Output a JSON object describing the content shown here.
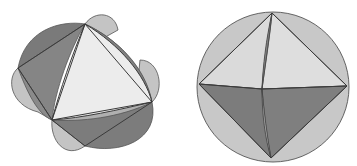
{
  "figures": [
    {
      "name": "curved-tetrahedron-projection",
      "description": "Polyhedron with triangular faces bulging into curved lobes",
      "colors": {
        "dark": "#7b7b7b",
        "mid": "#a9a9a9",
        "light": "#c9c9c9",
        "lightest": "#ececec",
        "edge": "#3a3a3a"
      }
    },
    {
      "name": "octahedron-in-sphere",
      "description": "Octahedron inscribed in a circle (sphere projection)",
      "colors": {
        "disc": "#c8c8c8",
        "upper_faces": "#dcdcdc",
        "lower_faces": "#7e7e7e",
        "edge": "#444444"
      }
    }
  ]
}
